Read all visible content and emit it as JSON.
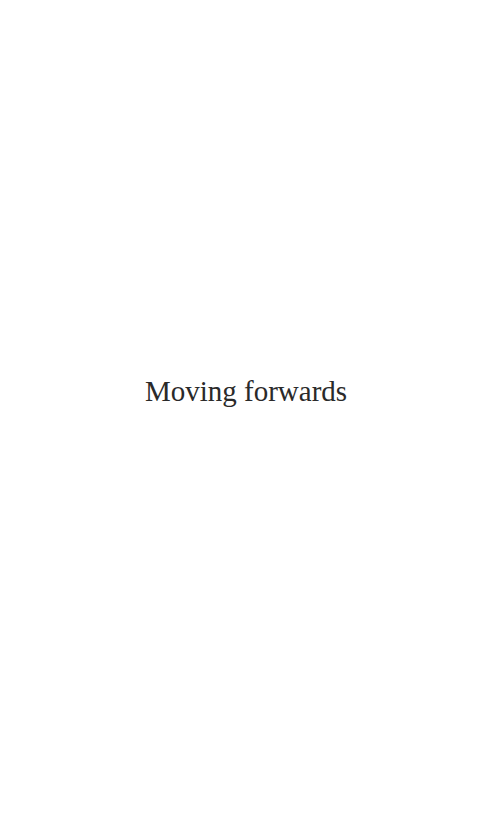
{
  "page": {
    "title": "Moving forwards",
    "text_color": "#2a2a2a",
    "background_color": "#ffffff"
  }
}
